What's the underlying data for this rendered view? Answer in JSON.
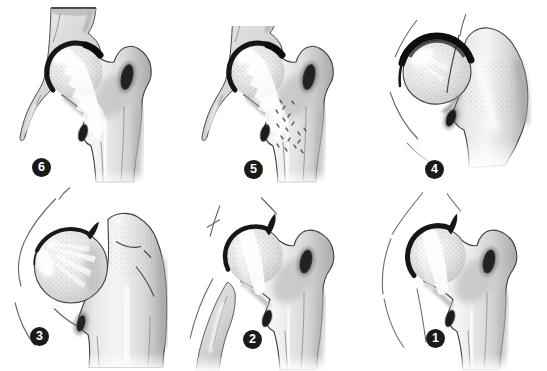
{
  "figure": {
    "background_color": "#ffffff",
    "badge_color": "#1a1a1a",
    "badge_text_color": "#ffffff",
    "panels": [
      {
        "number": "6",
        "illustration": "hip-joint-reduced-with-trabecular-pattern"
      },
      {
        "number": "5",
        "illustration": "hip-joint-reduced-with-stippled-metaphysis"
      },
      {
        "number": "4",
        "illustration": "hip-joint-displaced-head-thick-rim"
      },
      {
        "number": "3",
        "illustration": "hip-joint-laterally-displaced-head"
      },
      {
        "number": "2",
        "illustration": "hip-joint-subluxated-with-pelvic-column"
      },
      {
        "number": "1",
        "illustration": "hip-joint-early-stage-capsule-lines"
      }
    ]
  }
}
